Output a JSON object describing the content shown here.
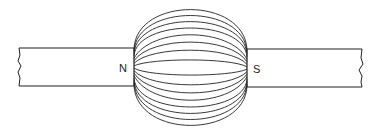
{
  "diagram": {
    "type": "magnetic-field",
    "magnets": [
      {
        "id": "left",
        "pole_label": "N",
        "facing": "right"
      },
      {
        "id": "right",
        "pole_label": "S",
        "facing": "left"
      }
    ],
    "field_lines": {
      "count": 16
    },
    "colors": {
      "stroke": "#222222",
      "background": "#ffffff"
    }
  }
}
